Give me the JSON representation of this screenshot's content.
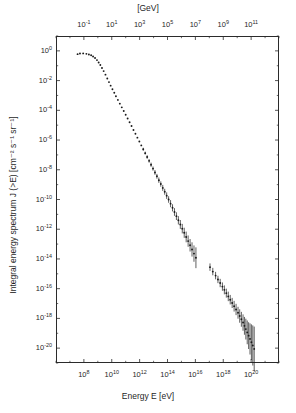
{
  "chart_data": {
    "type": "scatter",
    "title": "",
    "xlabel": "Energy E [eV]",
    "ylabel": "Integral energy spectrum J (>E) [cm⁻² s⁻¹ sr⁻¹]",
    "top_axis_label": "[GeV]",
    "xscale": "log",
    "yscale": "log",
    "xlim": [
      1000000.0,
      1e+22
    ],
    "ylim": [
      1e-21,
      10.0
    ],
    "grid": false,
    "legend": null,
    "marker": "filled-circle",
    "marker_color": "#1a1a1a",
    "errorbars": true,
    "x_ticks": [
      {
        "value": 100000000.0,
        "label_mantissa": "10",
        "label_exponent": "8"
      },
      {
        "value": 10000000000.0,
        "label_mantissa": "10",
        "label_exponent": "10"
      },
      {
        "value": 1000000000000.0,
        "label_mantissa": "10",
        "label_exponent": "12"
      },
      {
        "value": 100000000000000.0,
        "label_mantissa": "10",
        "label_exponent": "14"
      },
      {
        "value": 1e+16,
        "label_mantissa": "10",
        "label_exponent": "16"
      },
      {
        "value": 1e+18,
        "label_mantissa": "10",
        "label_exponent": "18"
      },
      {
        "value": 1e+20,
        "label_mantissa": "10",
        "label_exponent": "20"
      }
    ],
    "top_x_ticks": [
      {
        "value_ev": 100000000.0,
        "label_mantissa": "10",
        "label_exponent": "-1"
      },
      {
        "value_ev": 10000000000.0,
        "label_mantissa": "10",
        "label_exponent": "1"
      },
      {
        "value_ev": 1000000000000.0,
        "label_mantissa": "10",
        "label_exponent": "3"
      },
      {
        "value_ev": 100000000000000.0,
        "label_mantissa": "10",
        "label_exponent": "5"
      },
      {
        "value_ev": 1e+16,
        "label_mantissa": "10",
        "label_exponent": "7"
      },
      {
        "value_ev": 1e+18,
        "label_mantissa": "10",
        "label_exponent": "9"
      },
      {
        "value_ev": 1e+20,
        "label_mantissa": "10",
        "label_exponent": "11"
      }
    ],
    "y_ticks": [
      {
        "value": 1.0,
        "label_mantissa": "10",
        "label_exponent": "0"
      },
      {
        "value": 0.01,
        "label_mantissa": "10",
        "label_exponent": "-2"
      },
      {
        "value": 0.0001,
        "label_mantissa": "10",
        "label_exponent": "-4"
      },
      {
        "value": 1e-06,
        "label_mantissa": "10",
        "label_exponent": "-6"
      },
      {
        "value": 1e-08,
        "label_mantissa": "10",
        "label_exponent": "-8"
      },
      {
        "value": 1e-10,
        "label_mantissa": "10",
        "label_exponent": "-10"
      },
      {
        "value": 1e-12,
        "label_mantissa": "10",
        "label_exponent": "-12"
      },
      {
        "value": 1e-14,
        "label_mantissa": "10",
        "label_exponent": "-14"
      },
      {
        "value": 1e-16,
        "label_mantissa": "10",
        "label_exponent": "-16"
      },
      {
        "value": 1e-18,
        "label_mantissa": "10",
        "label_exponent": "-18"
      },
      {
        "value": 1e-20,
        "label_mantissa": "10",
        "label_exponent": "-20"
      }
    ],
    "points": [
      {
        "logx": 7.55,
        "logy": -0.22,
        "err": 0
      },
      {
        "logx": 7.72,
        "logy": -0.18,
        "err": 0
      },
      {
        "logx": 7.95,
        "logy": -0.17,
        "err": 0
      },
      {
        "logx": 8.18,
        "logy": -0.2,
        "err": 0
      },
      {
        "logx": 8.36,
        "logy": -0.24,
        "err": 0
      },
      {
        "logx": 8.52,
        "logy": -0.3,
        "err": 0
      },
      {
        "logx": 8.66,
        "logy": -0.38,
        "err": 0
      },
      {
        "logx": 8.8,
        "logy": -0.48,
        "err": 0
      },
      {
        "logx": 8.94,
        "logy": -0.62,
        "err": 0
      },
      {
        "logx": 9.06,
        "logy": -0.78,
        "err": 0
      },
      {
        "logx": 9.18,
        "logy": -0.95,
        "err": 0
      },
      {
        "logx": 9.3,
        "logy": -1.15,
        "err": 0
      },
      {
        "logx": 9.42,
        "logy": -1.36,
        "err": 0
      },
      {
        "logx": 9.55,
        "logy": -1.6,
        "err": 0
      },
      {
        "logx": 9.68,
        "logy": -1.86,
        "err": 0
      },
      {
        "logx": 9.8,
        "logy": -2.1,
        "err": 0
      },
      {
        "logx": 9.92,
        "logy": -2.34,
        "err": 0
      },
      {
        "logx": 10.05,
        "logy": -2.58,
        "err": 0
      },
      {
        "logx": 10.18,
        "logy": -2.82,
        "err": 0
      },
      {
        "logx": 10.3,
        "logy": -3.05,
        "err": 0
      },
      {
        "logx": 10.44,
        "logy": -3.3,
        "err": 0
      },
      {
        "logx": 10.58,
        "logy": -3.55,
        "err": 0
      },
      {
        "logx": 10.72,
        "logy": -3.8,
        "err": 0
      },
      {
        "logx": 10.86,
        "logy": -4.05,
        "err": 0
      },
      {
        "logx": 11.0,
        "logy": -4.3,
        "err": 0
      },
      {
        "logx": 11.14,
        "logy": -4.55,
        "err": 0
      },
      {
        "logx": 11.28,
        "logy": -4.8,
        "err": 0
      },
      {
        "logx": 11.42,
        "logy": -5.06,
        "err": 0
      },
      {
        "logx": 11.56,
        "logy": -5.32,
        "err": 0
      },
      {
        "logx": 11.7,
        "logy": -5.58,
        "err": 0
      },
      {
        "logx": 11.84,
        "logy": -5.84,
        "err": 0
      },
      {
        "logx": 11.98,
        "logy": -6.1,
        "err": 0
      },
      {
        "logx": 12.12,
        "logy": -6.36,
        "err": 0
      },
      {
        "logx": 12.26,
        "logy": -6.62,
        "err": 0.1
      },
      {
        "logx": 12.4,
        "logy": -6.88,
        "err": 0.1
      },
      {
        "logx": 12.54,
        "logy": -7.14,
        "err": 0.12
      },
      {
        "logx": 12.68,
        "logy": -7.4,
        "err": 0.12
      },
      {
        "logx": 12.82,
        "logy": -7.66,
        "err": 0.14
      },
      {
        "logx": 12.96,
        "logy": -7.92,
        "err": 0.14
      },
      {
        "logx": 13.1,
        "logy": -8.18,
        "err": 0.16
      },
      {
        "logx": 13.24,
        "logy": -8.44,
        "err": 0.16
      },
      {
        "logx": 13.38,
        "logy": -8.7,
        "err": 0.18
      },
      {
        "logx": 13.52,
        "logy": -8.96,
        "err": 0.18
      },
      {
        "logx": 13.66,
        "logy": -9.22,
        "err": 0.2
      },
      {
        "logx": 13.8,
        "logy": -9.48,
        "err": 0.2
      },
      {
        "logx": 13.94,
        "logy": -9.74,
        "err": 0.22
      },
      {
        "logx": 14.08,
        "logy": -10.0,
        "err": 0.22
      },
      {
        "logx": 14.22,
        "logy": -10.28,
        "err": 0.24
      },
      {
        "logx": 14.36,
        "logy": -10.56,
        "err": 0.24
      },
      {
        "logx": 14.5,
        "logy": -10.84,
        "err": 0.26
      },
      {
        "logx": 14.64,
        "logy": -11.12,
        "err": 0.26
      },
      {
        "logx": 14.78,
        "logy": -11.4,
        "err": 0.28
      },
      {
        "logx": 14.92,
        "logy": -11.68,
        "err": 0.3
      },
      {
        "logx": 15.06,
        "logy": -11.96,
        "err": 0.32
      },
      {
        "logx": 15.2,
        "logy": -12.24,
        "err": 0.34
      },
      {
        "logx": 15.34,
        "logy": -12.52,
        "err": 0.36
      },
      {
        "logx": 15.48,
        "logy": -12.8,
        "err": 0.38
      },
      {
        "logx": 15.62,
        "logy": -13.08,
        "err": 0.42
      },
      {
        "logx": 15.76,
        "logy": -13.36,
        "err": 0.48
      },
      {
        "logx": 15.9,
        "logy": -13.64,
        "err": 0.55
      },
      {
        "logx": 16.04,
        "logy": -13.92,
        "err": 0.7
      },
      {
        "logx": 17.05,
        "logy": -14.55,
        "err": 0.25
      },
      {
        "logx": 17.25,
        "logy": -14.85,
        "err": 0.25
      },
      {
        "logx": 17.45,
        "logy": -15.12,
        "err": 0.25
      },
      {
        "logx": 17.62,
        "logy": -15.38,
        "err": 0.25
      },
      {
        "logx": 17.78,
        "logy": -15.62,
        "err": 0.28
      },
      {
        "logx": 17.94,
        "logy": -15.86,
        "err": 0.28
      },
      {
        "logx": 18.08,
        "logy": -16.08,
        "err": 0.3
      },
      {
        "logx": 18.22,
        "logy": -16.3,
        "err": 0.3
      },
      {
        "logx": 18.36,
        "logy": -16.52,
        "err": 0.32
      },
      {
        "logx": 18.5,
        "logy": -16.74,
        "err": 0.32
      },
      {
        "logx": 18.64,
        "logy": -16.96,
        "err": 0.34
      },
      {
        "logx": 18.78,
        "logy": -17.18,
        "err": 0.36
      },
      {
        "logx": 18.92,
        "logy": -17.4,
        "err": 0.38
      },
      {
        "logx": 19.06,
        "logy": -17.62,
        "err": 0.4
      },
      {
        "logx": 19.18,
        "logy": -17.84,
        "err": 0.45
      },
      {
        "logx": 19.3,
        "logy": -18.06,
        "err": 0.5
      },
      {
        "logx": 19.42,
        "logy": -18.28,
        "err": 0.55
      },
      {
        "logx": 19.52,
        "logy": -18.5,
        "err": 0.6
      },
      {
        "logx": 19.62,
        "logy": -18.72,
        "err": 0.7
      },
      {
        "logx": 19.72,
        "logy": -18.94,
        "err": 0.8
      },
      {
        "logx": 19.82,
        "logy": -19.16,
        "err": 0.9
      },
      {
        "logx": 19.92,
        "logy": -19.38,
        "err": 1.05
      },
      {
        "logx": 20.02,
        "logy": -19.6,
        "err": 1.2
      },
      {
        "logx": 20.12,
        "logy": -19.82,
        "err": 1.35
      },
      {
        "logx": 20.22,
        "logy": -20.05,
        "err": 1.5
      }
    ]
  },
  "caption": {
    "fragment": ""
  }
}
